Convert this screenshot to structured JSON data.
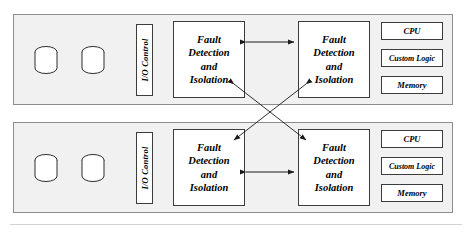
{
  "diagram": {
    "type": "block-diagram",
    "colors": {
      "panel_fill": "#f1f1f1",
      "panel_border": "#8d8d8d",
      "box_fill": "#ffffff",
      "box_border": "#3c3c3c",
      "arrow": "#1a1a1a",
      "page": "#ffffff"
    },
    "nodes": [
      {
        "id": "node-top",
        "storage": [
          {
            "label": "",
            "shape": "cylinder"
          },
          {
            "label": "",
            "shape": "cylinder"
          }
        ],
        "io_control": "I/O Control",
        "fdi_left": [
          "Fault",
          "Detection",
          "and",
          "Isolation"
        ],
        "fdi_right": [
          "Fault",
          "Detection",
          "and",
          "Isolation"
        ],
        "components": [
          "CPU",
          "Custom Logic",
          "Memory"
        ]
      },
      {
        "id": "node-bottom",
        "storage": [
          {
            "label": "",
            "shape": "cylinder"
          },
          {
            "label": "",
            "shape": "cylinder"
          }
        ],
        "io_control": "I/O Control",
        "fdi_left": [
          "Fault",
          "Detection",
          "and",
          "Isolation"
        ],
        "fdi_right": [
          "Fault",
          "Detection",
          "and",
          "Isolation"
        ],
        "components": [
          "CPU",
          "Custom Logic",
          "Memory"
        ]
      }
    ],
    "connections": [
      {
        "id": "intra-top",
        "from": "node-top.fdi_left",
        "to": "node-top.fdi_right",
        "style": "double-arrow",
        "orientation": "horizontal"
      },
      {
        "id": "intra-bottom",
        "from": "node-bottom.fdi_left",
        "to": "node-bottom.fdi_right",
        "style": "double-arrow",
        "orientation": "horizontal"
      },
      {
        "id": "cross-a",
        "from": "node-top.fdi_left",
        "to": "node-bottom.fdi_right",
        "style": "double-arrow",
        "orientation": "diagonal"
      },
      {
        "id": "cross-b",
        "from": "node-top.fdi_right",
        "to": "node-bottom.fdi_left",
        "style": "double-arrow",
        "orientation": "diagonal"
      }
    ]
  }
}
